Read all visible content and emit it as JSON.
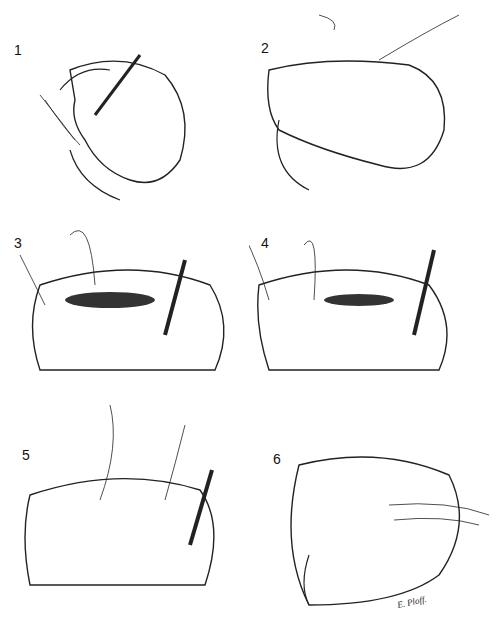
{
  "figure": {
    "panels": [
      {
        "label": "1",
        "description": "bowel loop with syringe injection and ties"
      },
      {
        "label": "2",
        "description": "curved bowel loop with suture"
      },
      {
        "label": "3",
        "description": "opened bowel segment with suture and tube"
      },
      {
        "label": "4",
        "description": "suturing of opened segment with tube"
      },
      {
        "label": "5",
        "description": "closed segment with suture and tube"
      },
      {
        "label": "6",
        "description": "completed closure of bowel loop"
      }
    ],
    "signature": "E. Ploff."
  }
}
